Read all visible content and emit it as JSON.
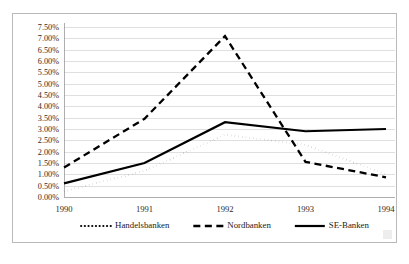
{
  "chart_data": {
    "type": "line",
    "title": "",
    "xlabel": "",
    "ylabel": "",
    "categories": [
      "1990",
      "1991",
      "1992",
      "1993",
      "1994"
    ],
    "x": [
      1990,
      1991,
      1992,
      1993,
      1994
    ],
    "ylim": [
      0.0,
      7.5
    ],
    "ytick_step": 0.5,
    "ytick_labels": [
      "0.00%",
      "0.50%",
      "1.00%",
      "1.50%",
      "2.00%",
      "2.50%",
      "3.00%",
      "3.50%",
      "4.00%",
      "4.50%",
      "5.00%",
      "5.50%",
      "6.00%",
      "6.50%",
      "7.00%",
      "7.50%"
    ],
    "ytick_values": [
      0.0,
      0.5,
      1.0,
      1.5,
      2.0,
      2.5,
      3.0,
      3.5,
      4.0,
      4.5,
      5.0,
      5.5,
      6.0,
      6.5,
      7.0,
      7.5
    ],
    "xtick_labels": [
      "1990",
      "1991",
      "1992",
      "1993",
      "1994"
    ],
    "grid": "horizontal",
    "legend_position": "bottom",
    "value_unit": "percent",
    "series": [
      {
        "name": "Handelsbanken",
        "style": "dotted",
        "color": "#000000",
        "line_width": 2.1,
        "dash": "0.1,3.6",
        "values": [
          0.25,
          1.15,
          2.75,
          2.3,
          1.0
        ]
      },
      {
        "name": "Nordbanken",
        "style": "dashed",
        "color": "#000000",
        "line_width": 2.3,
        "dash": "7,4.5",
        "values": [
          1.3,
          3.45,
          7.1,
          1.55,
          0.87
        ]
      },
      {
        "name": "SE-Banken",
        "style": "solid",
        "color": "#000000",
        "line_width": 2.2,
        "dash": "none",
        "values": [
          0.6,
          1.5,
          3.3,
          2.9,
          3.0
        ]
      }
    ]
  }
}
